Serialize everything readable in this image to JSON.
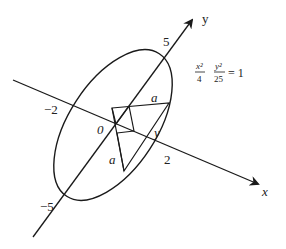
{
  "diagram": {
    "equation": {
      "term1_num": "x²",
      "term1_den": "4",
      "term2_num": "y²",
      "term2_den": "25",
      "rhs": "= 1"
    },
    "axes": {
      "x_label": "x",
      "y_label": "y"
    },
    "ticks": {
      "y_pos": "5",
      "y_neg": "−5",
      "x_pos": "2",
      "x_neg": "−2",
      "origin": "0"
    },
    "annotations": {
      "side_a_top": "a",
      "side_a_left": "a",
      "point_y": "y"
    },
    "colors": {
      "stroke": "#1a1a1a",
      "background": "#ffffff"
    }
  }
}
